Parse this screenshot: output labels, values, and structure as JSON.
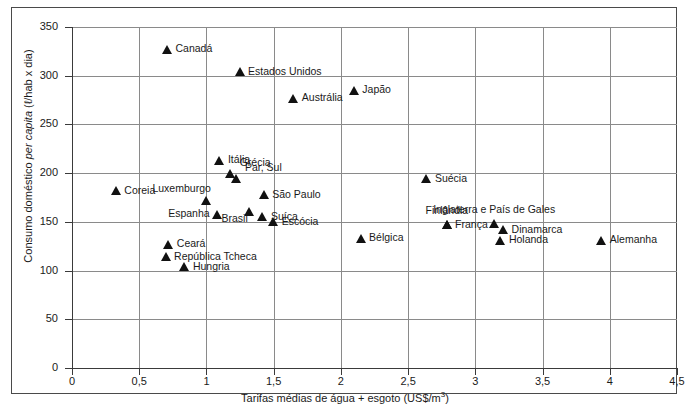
{
  "chart_data": {
    "type": "scatter",
    "title": "",
    "xlabel": "Tarifas médias de água + esgoto (US$/m3)",
    "ylabel": "Consumo doméstico per capita (l/hab x dia)",
    "xlim": [
      0,
      4.5
    ],
    "ylim": [
      0,
      350
    ],
    "xticks": [
      "0",
      "0,5",
      "1",
      "1,5",
      "2",
      "2,5",
      "3",
      "3,5",
      "4",
      "4,5"
    ],
    "xtick_values": [
      0,
      0.5,
      1,
      1.5,
      2,
      2.5,
      3,
      3.5,
      4,
      4.5
    ],
    "yticks": [
      "0",
      "50",
      "100",
      "150",
      "200",
      "250",
      "300",
      "350"
    ],
    "ytick_values": [
      0,
      50,
      100,
      150,
      200,
      250,
      300,
      350
    ],
    "grid": true,
    "legend": "none",
    "marker": "triangle",
    "marker_color": "#111111",
    "points": [
      {
        "label": "Canadá",
        "x": 0.71,
        "y": 327,
        "label_pos": "right"
      },
      {
        "label": "Estados Unidos",
        "x": 1.25,
        "y": 304,
        "label_pos": "right"
      },
      {
        "label": "Japão",
        "x": 2.1,
        "y": 285,
        "label_pos": "right"
      },
      {
        "label": "Austrália",
        "x": 1.65,
        "y": 277,
        "label_pos": "right"
      },
      {
        "label": "Itália",
        "x": 1.1,
        "y": 213,
        "label_pos": "right"
      },
      {
        "label": "Grécia",
        "x": 1.18,
        "y": 200,
        "label_pos": "above-right"
      },
      {
        "label": "Par, Sul",
        "x": 1.22,
        "y": 195,
        "label_pos": "above-right"
      },
      {
        "label": "Suécia",
        "x": 2.64,
        "y": 194,
        "label_pos": "right"
      },
      {
        "label": "Coreia",
        "x": 0.33,
        "y": 182,
        "label_pos": "right"
      },
      {
        "label": "São Paulo",
        "x": 1.43,
        "y": 178,
        "label_pos": "right"
      },
      {
        "label": "Luxemburgo",
        "x": 1.0,
        "y": 172,
        "label_pos": "above-left"
      },
      {
        "label": "Brasil",
        "x": 1.32,
        "y": 161,
        "label_pos": "below-left"
      },
      {
        "label": "Espanha",
        "x": 1.08,
        "y": 158,
        "label_pos": "left"
      },
      {
        "label": "Suíça",
        "x": 1.42,
        "y": 155,
        "label_pos": "right"
      },
      {
        "label": "Escócia",
        "x": 1.5,
        "y": 150,
        "label_pos": "right"
      },
      {
        "label": "Inglaterra e País de Gales",
        "x": 3.14,
        "y": 148,
        "label_pos": "above"
      },
      {
        "label": "Finlândia",
        "x": 2.79,
        "y": 147,
        "label_pos": "above"
      },
      {
        "label": "França",
        "x": 2.79,
        "y": 147,
        "label_pos": "right"
      },
      {
        "label": "Dinamarca",
        "x": 3.21,
        "y": 142,
        "label_pos": "right"
      },
      {
        "label": "Bélgica",
        "x": 2.15,
        "y": 133,
        "label_pos": "right"
      },
      {
        "label": "Alemanha",
        "x": 3.94,
        "y": 131,
        "label_pos": "right"
      },
      {
        "label": "Holanda",
        "x": 3.19,
        "y": 131,
        "label_pos": "right"
      },
      {
        "label": "Ceará",
        "x": 0.72,
        "y": 127,
        "label_pos": "right"
      },
      {
        "label": "República Tcheca",
        "x": 0.7,
        "y": 114,
        "label_pos": "right"
      },
      {
        "label": "Hungria",
        "x": 0.84,
        "y": 104,
        "label_pos": "right"
      }
    ]
  },
  "axes": {
    "x_title_main": "Tarifas médias de água + esgoto (US$/m",
    "x_title_sup": "3",
    "x_title_tail": ")",
    "y_title_pre": "Consumo doméstico ",
    "y_title_ital": "per capita",
    "y_title_post": " (ℓ/hab x dia)"
  },
  "caption": ""
}
